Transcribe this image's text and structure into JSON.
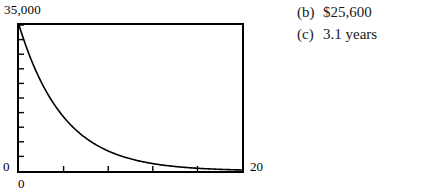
{
  "figure": {
    "y_axis_top_label": "35,000",
    "y_axis_bottom_label": "0",
    "x_axis_left_label": "0",
    "x_axis_right_label": "20"
  },
  "answers": [
    {
      "tag": "(b)",
      "text": "$25,600"
    },
    {
      "tag": "(c)",
      "text": "3.1 years"
    }
  ],
  "chart_data": {
    "type": "line",
    "title": "",
    "xlabel": "",
    "ylabel": "",
    "xlim": [
      0,
      20
    ],
    "ylim": [
      0,
      35000
    ],
    "grid": false,
    "legend": null,
    "x_ticks": [
      0,
      4,
      8,
      12,
      16,
      20
    ],
    "y_ticks": [
      0,
      3500,
      7000,
      10500,
      14000,
      17500,
      21000,
      24500,
      28000,
      31500,
      35000
    ],
    "x_tick_labels": [
      "0",
      "",
      "",
      "",
      "",
      "20"
    ],
    "y_tick_labels": [
      "0",
      "",
      "",
      "",
      "",
      "",
      "",
      "",
      "",
      "",
      "35,000"
    ],
    "series": [
      {
        "name": "value",
        "x": [
          0,
          1,
          2,
          3,
          4,
          5,
          6,
          7,
          8,
          9,
          10,
          11,
          12,
          13,
          14,
          15,
          16,
          17,
          18,
          19,
          20
        ],
        "y": [
          35000,
          27300,
          21294,
          16609,
          12955,
          10105,
          7882,
          6148,
          4795,
          3740,
          2917,
          2275,
          1775,
          1384,
          1080,
          842,
          657,
          512,
          400,
          312,
          243
        ]
      }
    ],
    "line_color": "#000000",
    "line_width": 1.6,
    "frame_color": "#000000"
  }
}
